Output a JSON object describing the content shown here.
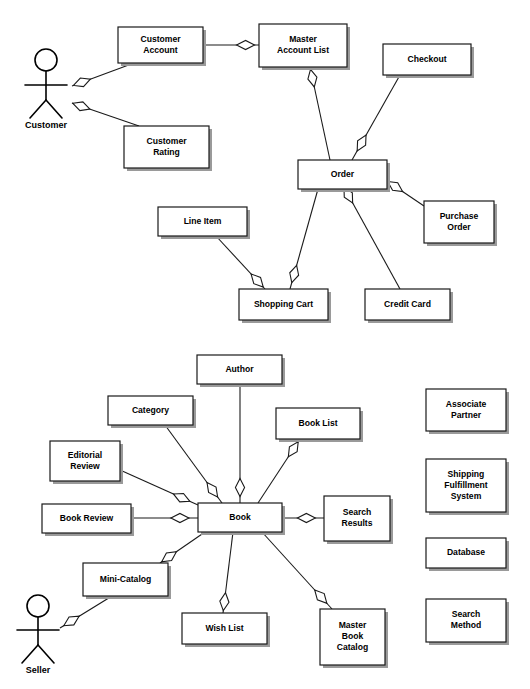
{
  "diagram": {
    "background_color": "#ffffff",
    "line_color": "#1a1a1a",
    "box_fill": "#ffffff",
    "shadow_color": "#9a9a9a",
    "text_color": "#000000"
  },
  "actors": [
    {
      "id": "customer",
      "label": "Customer",
      "x": 46,
      "y": 60,
      "head_r": 11,
      "body_top": 71,
      "body_bottom": 100,
      "arm_y": 85,
      "arm_half": 21,
      "leg_span": 16,
      "leg_bottom": 118,
      "label_y": 126
    },
    {
      "id": "seller",
      "label": "Seller",
      "x": 38,
      "y": 606,
      "head_r": 11,
      "body_top": 617,
      "body_bottom": 645,
      "arm_y": 630,
      "arm_half": 21,
      "leg_span": 16,
      "leg_bottom": 663,
      "label_y": 671
    }
  ],
  "boxes": [
    {
      "id": "customer-account",
      "label": "Customer\nAccount",
      "x": 118,
      "y": 27,
      "w": 85,
      "h": 36
    },
    {
      "id": "master-account-list",
      "label": "Master\nAccount List",
      "x": 259,
      "y": 24,
      "w": 88,
      "h": 43
    },
    {
      "id": "checkout",
      "label": "Checkout",
      "x": 383,
      "y": 44,
      "w": 88,
      "h": 31
    },
    {
      "id": "customer-rating",
      "label": "Customer\nRating",
      "x": 124,
      "y": 126,
      "w": 85,
      "h": 42
    },
    {
      "id": "order",
      "label": "Order",
      "x": 298,
      "y": 160,
      "w": 89,
      "h": 29
    },
    {
      "id": "line-item",
      "label": "Line Item",
      "x": 158,
      "y": 207,
      "w": 89,
      "h": 29
    },
    {
      "id": "purchase-order",
      "label": "Purchase\nOrder",
      "x": 424,
      "y": 201,
      "w": 70,
      "h": 42
    },
    {
      "id": "shopping-cart",
      "label": "Shopping Cart",
      "x": 239,
      "y": 289,
      "w": 89,
      "h": 31
    },
    {
      "id": "credit-card",
      "label": "Credit Card",
      "x": 365,
      "y": 289,
      "w": 85,
      "h": 31
    },
    {
      "id": "author",
      "label": "Author",
      "x": 197,
      "y": 355,
      "w": 85,
      "h": 29
    },
    {
      "id": "category",
      "label": "Category",
      "x": 108,
      "y": 396,
      "w": 85,
      "h": 29
    },
    {
      "id": "book-list",
      "label": "Book List",
      "x": 276,
      "y": 408,
      "w": 84,
      "h": 31
    },
    {
      "id": "associate-partner",
      "label": "Associate\nPartner",
      "x": 426,
      "y": 389,
      "w": 80,
      "h": 42
    },
    {
      "id": "editorial-review",
      "label": "Editorial\nReview",
      "x": 50,
      "y": 441,
      "w": 70,
      "h": 40
    },
    {
      "id": "shipping-system",
      "label": "Shipping\nFulfillment\nSystem",
      "x": 426,
      "y": 459,
      "w": 80,
      "h": 53
    },
    {
      "id": "book-review",
      "label": "Book Review",
      "x": 42,
      "y": 504,
      "w": 89,
      "h": 29
    },
    {
      "id": "book",
      "label": "Book",
      "x": 198,
      "y": 503,
      "w": 84,
      "h": 29
    },
    {
      "id": "search-results",
      "label": "Search\nResults",
      "x": 324,
      "y": 496,
      "w": 66,
      "h": 45
    },
    {
      "id": "database",
      "label": "Database",
      "x": 426,
      "y": 538,
      "w": 80,
      "h": 30
    },
    {
      "id": "mini-catalog",
      "label": "Mini-Catalog",
      "x": 83,
      "y": 563,
      "w": 85,
      "h": 33
    },
    {
      "id": "search-method",
      "label": "Search\nMethod",
      "x": 426,
      "y": 599,
      "w": 80,
      "h": 43
    },
    {
      "id": "wish-list",
      "label": "Wish List",
      "x": 182,
      "y": 613,
      "w": 85,
      "h": 31
    },
    {
      "id": "master-book-catalog",
      "label": "Master\nBook\nCatalog",
      "x": 320,
      "y": 609,
      "w": 65,
      "h": 56
    }
  ],
  "associations": [
    {
      "id": "customer-to-customer-account",
      "from": [
        72,
        86
      ],
      "to": [
        134,
        63
      ],
      "diamond_at": "from",
      "diamond_pos": 0.16
    },
    {
      "id": "customer-to-customer-rating",
      "from": [
        72,
        103
      ],
      "to": [
        139,
        126
      ],
      "diamond_at": "from",
      "diamond_pos": 0.14
    },
    {
      "id": "customer-account-to-master",
      "from": [
        203,
        45
      ],
      "to": [
        259,
        45
      ],
      "diamond_at": "to",
      "diamond_pos": 0.76
    },
    {
      "id": "master-account-list-to-order",
      "from": [
        310,
        67
      ],
      "to": [
        330,
        160
      ],
      "diamond_at": "from",
      "diamond_pos": 0.12
    },
    {
      "id": "checkout-to-order",
      "from": [
        400,
        75
      ],
      "to": [
        352,
        160
      ],
      "diamond_at": "to",
      "diamond_pos": 0.8
    },
    {
      "id": "order-to-purchase-order",
      "from": [
        387,
        181
      ],
      "to": [
        424,
        206
      ],
      "diamond_at": "from",
      "diamond_pos": 0.22
    },
    {
      "id": "order-to-shopping-cart",
      "from": [
        318,
        189
      ],
      "to": [
        290,
        289
      ],
      "diamond_at": "to",
      "diamond_pos": 0.85
    },
    {
      "id": "order-to-credit-card",
      "from": [
        345,
        189
      ],
      "to": [
        400,
        289
      ],
      "diamond_at": "from",
      "diamond_pos": 0.06
    },
    {
      "id": "line-item-to-shopping-cart",
      "from": [
        216,
        236
      ],
      "to": [
        265,
        289
      ],
      "diamond_at": "to",
      "diamond_pos": 0.84
    },
    {
      "id": "author-to-book",
      "from": [
        240,
        384
      ],
      "to": [
        240,
        503
      ],
      "diamond_at": "to",
      "diamond_pos": 0.87
    },
    {
      "id": "category-to-book",
      "from": [
        165,
        425
      ],
      "to": [
        222,
        503
      ],
      "diamond_at": "to",
      "diamond_pos": 0.83
    },
    {
      "id": "book-list-to-book",
      "from": [
        300,
        439
      ],
      "to": [
        258,
        503
      ],
      "diamond_at": "from",
      "diamond_pos": 0.16
    },
    {
      "id": "editorial-review-to-book",
      "from": [
        120,
        470
      ],
      "to": [
        198,
        505
      ],
      "diamond_at": "to",
      "diamond_pos": 0.79
    },
    {
      "id": "book-review-to-book",
      "from": [
        131,
        518
      ],
      "to": [
        198,
        518
      ],
      "diamond_at": "to",
      "diamond_pos": 0.73
    },
    {
      "id": "book-to-search-results",
      "from": [
        282,
        518
      ],
      "to": [
        324,
        518
      ],
      "diamond_at": "to",
      "diamond_pos": 0.58
    },
    {
      "id": "mini-catalog-to-book",
      "from": [
        160,
        563
      ],
      "to": [
        205,
        532
      ],
      "diamond_at": "from",
      "diamond_pos": 0.2
    },
    {
      "id": "seller-to-mini-catalog",
      "from": [
        60,
        628
      ],
      "to": [
        112,
        596
      ],
      "diamond_at": "from",
      "diamond_pos": 0.22
    },
    {
      "id": "book-to-wish-list",
      "from": [
        233,
        532
      ],
      "to": [
        223,
        613
      ],
      "diamond_at": "to",
      "diamond_pos": 0.86
    },
    {
      "id": "book-to-master-book-catalog",
      "from": [
        262,
        532
      ],
      "to": [
        332,
        609
      ],
      "diamond_at": "to",
      "diamond_pos": 0.84
    }
  ]
}
